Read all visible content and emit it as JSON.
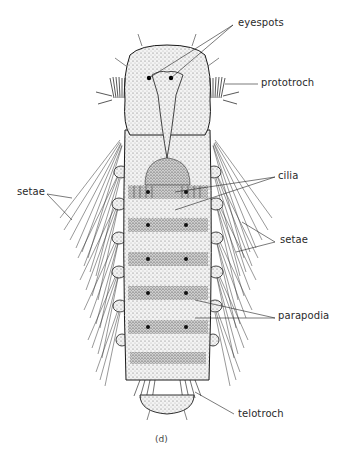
{
  "figure": {
    "caption": "(d)",
    "labels": {
      "eyespots": "eyespots",
      "prototroch": "prototroch",
      "setae_left": "setae",
      "cilia": "cilia",
      "setae_right": "setae",
      "parapodia": "parapodia",
      "telotroch": "telotroch"
    }
  },
  "colors": {
    "ink": "#1a1a1a",
    "body_fill": "#e9e9e9",
    "background": "#ffffff",
    "label_text": "#2a2a2a"
  }
}
